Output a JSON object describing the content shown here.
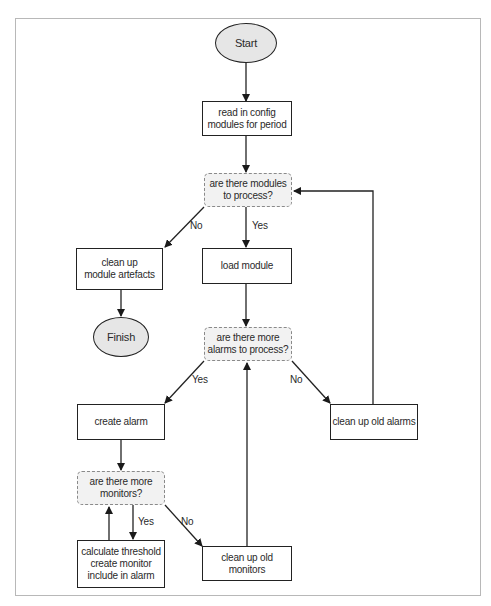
{
  "diagram": {
    "type": "flowchart",
    "nodes": {
      "start": {
        "kind": "terminal",
        "label": "Start"
      },
      "read_config": {
        "kind": "process",
        "label": "read in config\nmodules for period"
      },
      "modules_decision": {
        "kind": "decision",
        "label": "are there modules\nto process?"
      },
      "cleanup_artefacts": {
        "kind": "process",
        "label": "clean up\nmodule artefacts"
      },
      "finish": {
        "kind": "terminal",
        "label": "Finish"
      },
      "load_module": {
        "kind": "process",
        "label": "load module"
      },
      "alarms_decision": {
        "kind": "decision",
        "label": "are there more\nalarms to process?"
      },
      "create_alarm": {
        "kind": "process",
        "label": "create alarm"
      },
      "cleanup_alarms": {
        "kind": "process",
        "label": "clean up old alarms"
      },
      "monitors_decision": {
        "kind": "decision",
        "label": "are there more\nmonitors?"
      },
      "calc_threshold": {
        "kind": "process",
        "label": "calculate threshold\ncreate monitor\ninclude in alarm"
      },
      "cleanup_monitors": {
        "kind": "process",
        "label": "clean up old monitors"
      }
    },
    "edge_labels": {
      "modules_no": "No",
      "modules_yes": "Yes",
      "alarms_yes": "Yes",
      "alarms_no": "No",
      "monitors_yes": "Yes",
      "monitors_no": "No"
    },
    "edges": [
      {
        "from": "start",
        "to": "read_config",
        "label": ""
      },
      {
        "from": "read_config",
        "to": "modules_decision",
        "label": ""
      },
      {
        "from": "modules_decision",
        "to": "cleanup_artefacts",
        "label": "No"
      },
      {
        "from": "modules_decision",
        "to": "load_module",
        "label": "Yes"
      },
      {
        "from": "cleanup_artefacts",
        "to": "finish",
        "label": ""
      },
      {
        "from": "load_module",
        "to": "alarms_decision",
        "label": ""
      },
      {
        "from": "alarms_decision",
        "to": "create_alarm",
        "label": "Yes"
      },
      {
        "from": "alarms_decision",
        "to": "cleanup_alarms",
        "label": "No"
      },
      {
        "from": "cleanup_alarms",
        "to": "modules_decision",
        "label": ""
      },
      {
        "from": "create_alarm",
        "to": "monitors_decision",
        "label": ""
      },
      {
        "from": "monitors_decision",
        "to": "calc_threshold",
        "label": "Yes"
      },
      {
        "from": "calc_threshold",
        "to": "monitors_decision",
        "label": ""
      },
      {
        "from": "monitors_decision",
        "to": "cleanup_monitors",
        "label": "No"
      },
      {
        "from": "cleanup_monitors",
        "to": "alarms_decision",
        "label": ""
      }
    ],
    "colors": {
      "terminal_fill": "#e6e6e6",
      "decision_fill": "#f2f2f2",
      "process_fill": "#ffffff",
      "line": "#222222",
      "frame": "#b8b8b8"
    }
  }
}
